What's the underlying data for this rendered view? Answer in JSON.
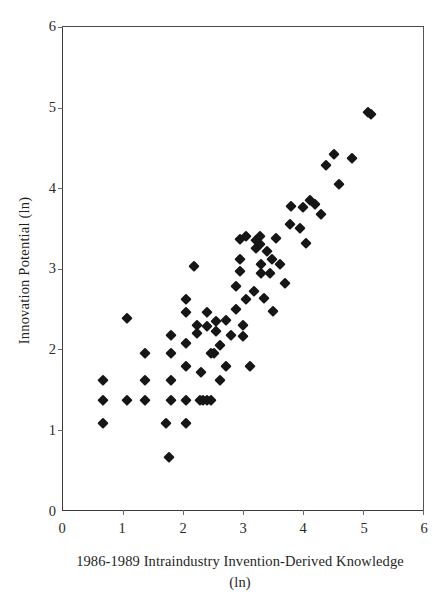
{
  "chart_data": {
    "type": "scatter",
    "title": "",
    "xlabel": "1986-1989 Intraindustry Invention-Derived Knowledge (ln)",
    "xlabel_line1": "1986-1989 Intraindustry Invention-Derived Knowledge",
    "xlabel_line2": "(ln)",
    "ylabel": "Innovation Potential (ln)",
    "xlim": [
      0,
      6
    ],
    "ylim": [
      0,
      6
    ],
    "xticks": [
      0,
      1,
      2,
      3,
      4,
      5,
      6
    ],
    "yticks": [
      0,
      1,
      2,
      3,
      4,
      5,
      6
    ],
    "xtick_labels": [
      "0",
      "1",
      "2",
      "3",
      "4",
      "5",
      "6"
    ],
    "ytick_labels": [
      "0",
      "1",
      "2",
      "3",
      "4",
      "5",
      "6"
    ],
    "grid": false,
    "legend": null,
    "marker": "diamond",
    "marker_color": "#161616",
    "n_points": 78,
    "points": [
      [
        0.67,
        1.61
      ],
      [
        0.67,
        1.37
      ],
      [
        0.67,
        1.08
      ],
      [
        1.06,
        2.38
      ],
      [
        1.06,
        1.37
      ],
      [
        1.36,
        1.95
      ],
      [
        1.36,
        1.61
      ],
      [
        1.36,
        1.37
      ],
      [
        1.72,
        1.08
      ],
      [
        1.76,
        0.66
      ],
      [
        1.8,
        2.18
      ],
      [
        1.8,
        1.95
      ],
      [
        1.8,
        1.61
      ],
      [
        1.8,
        1.37
      ],
      [
        2.05,
        2.62
      ],
      [
        2.05,
        2.07
      ],
      [
        2.05,
        1.79
      ],
      [
        2.05,
        1.37
      ],
      [
        2.05,
        1.08
      ],
      [
        2.18,
        3.03
      ],
      [
        2.23,
        2.3
      ],
      [
        2.23,
        2.2
      ],
      [
        2.28,
        1.37
      ],
      [
        2.34,
        1.37
      ],
      [
        2.4,
        1.37
      ],
      [
        2.46,
        1.37
      ],
      [
        2.3,
        1.72
      ],
      [
        2.4,
        2.46
      ],
      [
        2.4,
        2.28
      ],
      [
        2.47,
        1.95
      ],
      [
        2.55,
        2.35
      ],
      [
        2.55,
        2.22
      ],
      [
        2.62,
        1.61
      ],
      [
        2.72,
        1.79
      ],
      [
        2.88,
        2.78
      ],
      [
        2.88,
        2.5
      ],
      [
        2.95,
        3.37
      ],
      [
        2.95,
        3.12
      ],
      [
        2.95,
        2.97
      ],
      [
        3.0,
        2.3
      ],
      [
        3.0,
        2.16
      ],
      [
        3.05,
        2.62
      ],
      [
        3.12,
        1.79
      ],
      [
        3.22,
        3.35
      ],
      [
        3.22,
        3.25
      ],
      [
        3.28,
        3.4
      ],
      [
        3.28,
        3.3
      ],
      [
        3.3,
        3.05
      ],
      [
        3.3,
        2.95
      ],
      [
        3.35,
        2.63
      ],
      [
        3.4,
        3.22
      ],
      [
        3.45,
        2.95
      ],
      [
        3.5,
        2.47
      ],
      [
        3.55,
        3.38
      ],
      [
        3.62,
        3.06
      ],
      [
        3.7,
        2.82
      ],
      [
        3.78,
        3.55
      ],
      [
        3.8,
        3.78
      ],
      [
        3.95,
        3.5
      ],
      [
        4.0,
        3.77
      ],
      [
        4.05,
        3.32
      ],
      [
        4.12,
        3.85
      ],
      [
        4.2,
        3.8
      ],
      [
        4.3,
        3.68
      ],
      [
        4.38,
        4.28
      ],
      [
        4.52,
        4.42
      ],
      [
        4.6,
        4.05
      ],
      [
        4.82,
        4.37
      ],
      [
        5.08,
        4.95
      ],
      [
        5.14,
        4.92
      ],
      [
        2.05,
        2.46
      ],
      [
        2.62,
        2.05
      ],
      [
        3.05,
        3.4
      ],
      [
        2.8,
        2.18
      ],
      [
        3.18,
        2.72
      ],
      [
        2.72,
        2.36
      ],
      [
        3.48,
        3.12
      ],
      [
        2.52,
        1.95
      ]
    ]
  }
}
